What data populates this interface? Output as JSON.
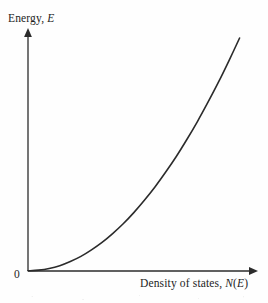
{
  "figure": {
    "background_color": "#fefefe",
    "ink_color": "#2b2b2b",
    "origin_label": "0"
  },
  "labels": {
    "y_axis_prefix": "Energy,",
    "y_axis_symbol": "E",
    "x_axis_prefix": "Density of states,",
    "x_axis_symbol_n": "N",
    "x_axis_open_paren": "(",
    "x_axis_symbol_e": "E",
    "x_axis_close_paren": ")"
  },
  "chart_data": {
    "type": "line",
    "title": "",
    "subtitle": "",
    "xlabel": "Density of states, N(E)",
    "ylabel": "Energy, E",
    "grid": false,
    "legend": null,
    "axis_arrows": true,
    "tick_labels": {
      "x": [],
      "y": [],
      "origin": "0"
    },
    "xlim": [
      0,
      1
    ],
    "ylim": [
      0,
      1
    ],
    "series": [
      {
        "name": "Density of states curve",
        "description": "Monotonically increasing convex curve; energy rises slowly at small density of states then steeply at large values (free-electron parabolic density of states, N(E) proportional to square root of E, drawn with E on the vertical axis).",
        "color": "#2b2b2b",
        "linewidth": 1.6,
        "x": [
          0.0,
          0.05,
          0.1,
          0.15,
          0.2,
          0.25,
          0.3,
          0.35,
          0.4,
          0.45,
          0.5,
          0.55,
          0.6,
          0.65,
          0.7,
          0.75,
          0.8,
          0.85,
          0.9,
          0.95,
          1.0
        ],
        "y": [
          0.0,
          0.003,
          0.01,
          0.022,
          0.04,
          0.062,
          0.09,
          0.122,
          0.16,
          0.202,
          0.25,
          0.303,
          0.36,
          0.423,
          0.49,
          0.563,
          0.64,
          0.723,
          0.81,
          0.903,
          1.0
        ]
      }
    ]
  }
}
